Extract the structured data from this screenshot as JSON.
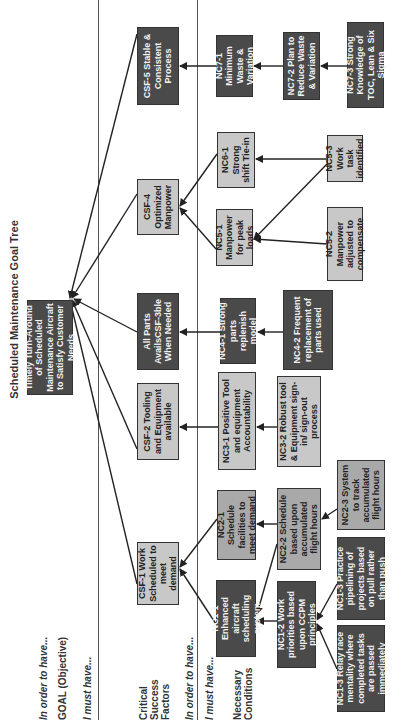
{
  "title": "Scheduled Maintenance Goal Tree",
  "side_labels": {
    "in_order_to_have_1": "In order to have...",
    "goal_label": "GOAL (Objective)",
    "i_must_have_1": "I must have...",
    "csf_label": "Critical Success Factors",
    "in_order_to_have_2": "In order to have...",
    "i_must_have_2": "I must have...",
    "nc_label": "Necessary Conditions"
  },
  "goal": {
    "text": "Timely Turn-Around of Scheduled Maintenance Aircraft to Satisfy Customer Needs"
  },
  "csf": [
    {
      "id": "CSF-1",
      "text": "CSF-1 Work Scheduled to meet demand"
    },
    {
      "id": "CSF-2",
      "text": "CSF-2 Tooling and Equipment available"
    },
    {
      "id": "CSF-3",
      "text": "All Parts AvailsCSF-3ble When Needed"
    },
    {
      "id": "CSF-4",
      "text": "CSF-4 Optimized Manpower"
    },
    {
      "id": "CSF-5",
      "text": "CSF-5 Stable & Consistent Process"
    }
  ],
  "nc": {
    "nc1_1": "NC1-1 Enhanced aircraft scheduling system",
    "nc1_2": "NC1-2 Work priorities based upon CCPM principles",
    "nc1_3a": "NC1-3 Practice pipelining of projects based on pull rather than push",
    "nc1_3b": "NC1-3 Relay race mentality where completed tasks are passed immediately",
    "nc2_1": "NC2-1 Schedule facilities to meet demand",
    "nc2_2": "NC2-2 Schedule based upon accumulated flight hours",
    "nc2_3": "NC2-3 System to track accumulated flight hours",
    "nc3_1": "NC3-1 Positive Tool and equipment Accountability",
    "nc3_2": "NC3-2 Robust tool & Equipment sign-in/ sign-out process",
    "nc4_1": "NC4-1 Strong parts replenish model",
    "nc4_2": "NC4-2 Frequent replacement of parts used",
    "nc5_1": "NC5-1 Manpower for peak loads",
    "nc5_2": "NC5-2 Manpower adjusted to compensate",
    "nc5_3": "NC5-3 Work task identified",
    "nc6_1": "NC6-1 Strong shift Tie-in",
    "nc7_1": "NC7-1 Minimum Waste & Variation",
    "nc7_2": "NC7-2 Plan to Reduce Waste & Variation",
    "nc7_3": "NC7-3 Strong Knowledge of TOC, Lean & Six Sigma"
  },
  "colors": {
    "dark_box": "#4a4a4a",
    "light_box": "#c8c8c8",
    "mid_box": "#a9a9a9",
    "line": "#222222"
  }
}
